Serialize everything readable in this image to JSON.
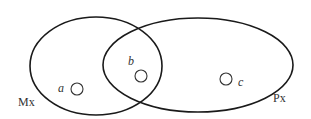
{
  "diagram": {
    "type": "venn",
    "sets": [
      {
        "id": "Mx",
        "label": "Mx",
        "shape": {
          "cx": 96,
          "cy": 66,
          "rx": 66,
          "ry": 49
        },
        "label_pos": {
          "x": 18,
          "y": 96
        }
      },
      {
        "id": "Px",
        "label": "Px",
        "shape": {
          "cx": 198,
          "cy": 65,
          "rx": 95,
          "ry": 47
        },
        "label_pos": {
          "x": 273,
          "y": 92
        }
      }
    ],
    "elements": [
      {
        "id": "a",
        "label": "a",
        "region": "Mx only",
        "dot": {
          "cx": 77,
          "cy": 89,
          "r": 6
        },
        "label_pos": {
          "x": 58,
          "y": 82
        }
      },
      {
        "id": "b",
        "label": "b",
        "region": "Mx ∩ Px",
        "dot": {
          "cx": 141,
          "cy": 76,
          "r": 6
        },
        "label_pos": {
          "x": 128,
          "y": 55
        }
      },
      {
        "id": "c",
        "label": "c",
        "region": "Px only",
        "dot": {
          "cx": 226,
          "cy": 79,
          "r": 6
        },
        "label_pos": {
          "x": 238,
          "y": 76
        }
      }
    ],
    "colors": {
      "stroke": "#1a1a1a",
      "text": "#333333",
      "background": "#ffffff"
    }
  }
}
